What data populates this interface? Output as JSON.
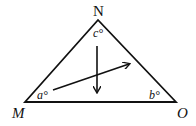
{
  "diagram": {
    "type": "triangle",
    "vertices": [
      {
        "id": "N",
        "label": "N",
        "angle_label": "c°"
      },
      {
        "id": "M",
        "label": "M",
        "angle_label": "a°"
      },
      {
        "id": "O",
        "label": "O",
        "angle_label": "b°"
      }
    ],
    "arrows": [
      {
        "name": "down-arrow",
        "direction": "down"
      },
      {
        "name": "rising-arrow",
        "direction": "up-right"
      }
    ],
    "colors": {
      "stroke": "#111111",
      "background": "#ffffff"
    }
  }
}
